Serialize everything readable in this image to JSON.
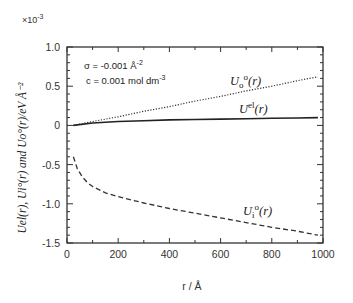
{
  "chart_data": {
    "type": "line",
    "title": "",
    "xlabel": "r / Å",
    "ylabel": "Uel(r), Ui0(r) and Uo0(r)/eV Å-2",
    "y_scale_factor": "×10⁻³",
    "xlim": [
      0,
      1000
    ],
    "ylim": [
      -1.5,
      1.0
    ],
    "x_ticks": [
      0,
      200,
      400,
      600,
      800,
      1000
    ],
    "x_tick_labels": [
      "0",
      "200",
      "400",
      "600",
      "800",
      "1000"
    ],
    "y_ticks": [
      1.0,
      0.5,
      0,
      -0.5,
      -1.0,
      -1.5
    ],
    "y_tick_labels": [
      "1.0",
      "0.5",
      "0",
      "-0.5",
      "-1.0",
      "-1.5"
    ],
    "grid": false,
    "legend": "inline labels",
    "annotations": [
      "σ = -0.001 Å⁻²",
      "c = 0.001 mol dm⁻³"
    ],
    "series": [
      {
        "name": "Uo0(r)",
        "style": "dotted",
        "x": [
          25,
          100,
          200,
          300,
          400,
          500,
          600,
          700,
          800,
          900,
          980
        ],
        "y": [
          0.0,
          0.05,
          0.11,
          0.18,
          0.24,
          0.31,
          0.37,
          0.44,
          0.5,
          0.57,
          0.62
        ]
      },
      {
        "name": "Uel(r)",
        "style": "solid",
        "x": [
          25,
          100,
          200,
          300,
          400,
          500,
          600,
          700,
          800,
          900,
          980
        ],
        "y": [
          0.0,
          0.03,
          0.05,
          0.06,
          0.07,
          0.075,
          0.08,
          0.085,
          0.09,
          0.095,
          0.1
        ]
      },
      {
        "name": "Ui0(r)",
        "style": "dashed",
        "x": [
          25,
          30,
          40,
          60,
          80,
          100,
          150,
          200,
          300,
          400,
          500,
          600,
          700,
          800,
          900,
          980
        ],
        "y": [
          -0.4,
          -0.45,
          -0.55,
          -0.66,
          -0.73,
          -0.78,
          -0.86,
          -0.91,
          -0.99,
          -1.06,
          -1.12,
          -1.18,
          -1.24,
          -1.3,
          -1.35,
          -1.4
        ]
      }
    ]
  },
  "labels": {
    "scale": "×10",
    "scale_exp": "-3",
    "annot_sigma": "σ = -0.001 Å",
    "annot_sigma_exp": "-2",
    "annot_c": "c = 0.001 mol dm",
    "annot_c_exp": "-3",
    "uo_main": "U",
    "uo_sub": "o",
    "uo_sup": "o",
    "uo_arg": "(r)",
    "uel_main": "U",
    "uel_sup": "el",
    "uel_arg": "(r)",
    "ui_main": "U",
    "ui_sub": "i",
    "ui_sup": "o",
    "ui_arg": "(r)",
    "xlabel": "r / Å",
    "ylabel": "Uel(r), Ui°(r) and Uo°(r)/eV Å⁻²"
  }
}
